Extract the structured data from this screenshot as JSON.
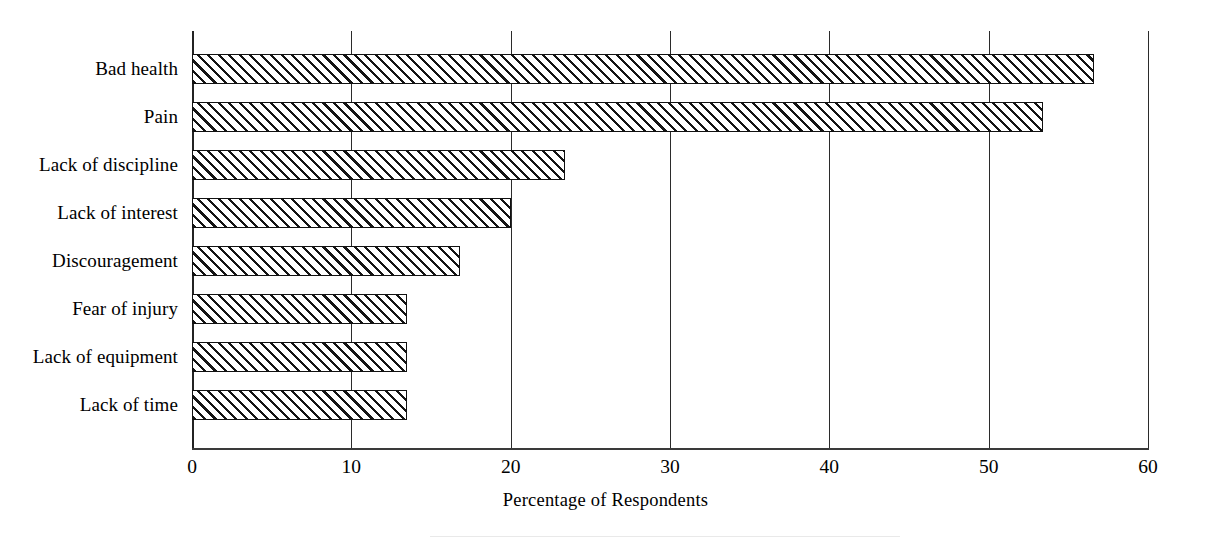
{
  "chart_data": {
    "type": "bar",
    "orientation": "horizontal",
    "title": "",
    "subtitle": "",
    "xlabel": "Percentage of Respondents",
    "ylabel": "",
    "categories": [
      "Bad health",
      "Pain",
      "Lack of discipline",
      "Lack of interest",
      "Discouragement",
      "Fear of injury",
      "Lack of equipment",
      "Lack of time"
    ],
    "values": [
      56.6,
      53.4,
      23.4,
      20.0,
      16.8,
      13.5,
      13.5,
      13.5
    ],
    "xlim": [
      0,
      60
    ],
    "xticks": [
      0,
      10,
      20,
      30,
      40,
      50,
      60
    ],
    "xtick_labels": [
      "0",
      "10",
      "20",
      "30",
      "40",
      "50",
      "60"
    ],
    "grid": "vertical-only",
    "legend": "none",
    "bar_style": {
      "fill": "diagonal-hatch",
      "hatch_direction": "forward-slash",
      "hatch_color": "#141414",
      "background_color": "#ffffff",
      "border_color": "#111111"
    },
    "colors": {
      "background": "#ffffff",
      "axis": "#2b2b2b",
      "text": "#000000"
    }
  }
}
